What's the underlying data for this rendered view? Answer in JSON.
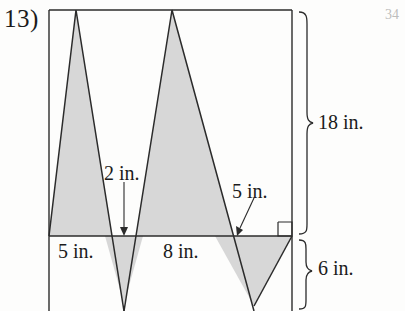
{
  "problem": {
    "number": "13)",
    "page_marker": "34"
  },
  "labels": {
    "height_total": "18 in.",
    "depth_below": "6 in.",
    "valley_depth": "2 in.",
    "right_segment": "5 in.",
    "base_first": "5 in.",
    "base_second": "8 in."
  },
  "colors": {
    "stroke": "#2b2b2b",
    "shade_fill": "#d6d6d6",
    "paper": "#fdfdfc",
    "faint_text": "#bdbdbd"
  },
  "figure": {
    "type": "zigzag-sawtooth-in-rectangle",
    "rect": {
      "left": 49,
      "right": 292,
      "top": 10,
      "baseline": 236,
      "bottom": 311
    },
    "apex_points_up": [
      76,
      172
    ],
    "valley_points_down": [
      124,
      254
    ],
    "right_angle_marker": {
      "x": 278,
      "y": 222,
      "size": 14
    }
  }
}
